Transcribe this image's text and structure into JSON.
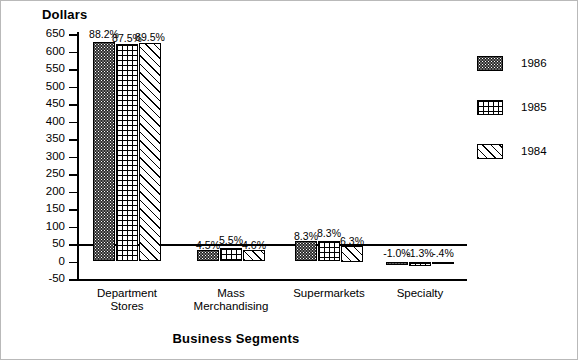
{
  "chart_data": {
    "type": "bar",
    "title": "",
    "xlabel": "Business Segments",
    "ylabel": "Dollars",
    "categories": [
      "Department Stores",
      "Mass Merchandising",
      "Supermarkets",
      "Specialty"
    ],
    "ylim": [
      -50,
      650
    ],
    "ytick_step": 50,
    "yticks": [
      650,
      600,
      550,
      500,
      450,
      400,
      350,
      300,
      250,
      200,
      150,
      100,
      50,
      0,
      -50
    ],
    "grid": false,
    "legend_position": "right",
    "series": [
      {
        "name": "1986",
        "pattern": "dark-stipple",
        "values": [
          628,
          32,
          59,
          -9
        ],
        "labels": [
          "88.2%",
          "4.5%",
          "8.3%",
          "-1.0%"
        ]
      },
      {
        "name": "1985",
        "pattern": "grid",
        "values": [
          622,
          39,
          59,
          -12
        ],
        "labels": [
          "87.5%",
          "5.5%",
          "8.3%",
          "-1.3%"
        ]
      },
      {
        "name": "1984",
        "pattern": "diagonal-hatch",
        "values": [
          624,
          33,
          45,
          -4
        ],
        "labels": [
          "89.5%",
          "4.6%",
          "6.3%",
          "-.4%"
        ]
      }
    ]
  },
  "colors": {
    "ink": "#000000",
    "paper": "#ffffff",
    "frame": "#b9b9b9"
  }
}
